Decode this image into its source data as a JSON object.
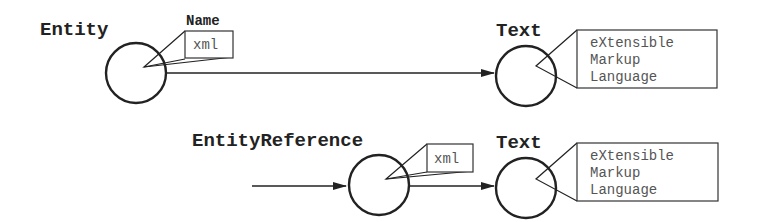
{
  "diagram": {
    "type": "dom-node-diagram",
    "colors": {
      "stroke": "#222222",
      "label": "#222222",
      "box_text": "#555555",
      "background": "#ffffff"
    },
    "row1": {
      "entity_node": {
        "label": "Entity",
        "attr_label": "Name",
        "attr_value": "xml"
      },
      "text_node": {
        "label": "Text",
        "lines": [
          "eXtensible",
          "Markup",
          "Language"
        ]
      }
    },
    "row2": {
      "entity_reference_node": {
        "label": "EntityReference",
        "attr_value": "xml"
      },
      "text_node": {
        "label": "Text",
        "lines": [
          "eXtensible",
          "Markup",
          "Language"
        ]
      }
    },
    "edges": [
      {
        "from": "Entity",
        "to": "Text"
      },
      {
        "from": "(incoming)",
        "to": "EntityReference"
      },
      {
        "from": "EntityReference",
        "to": "Text"
      }
    ]
  }
}
